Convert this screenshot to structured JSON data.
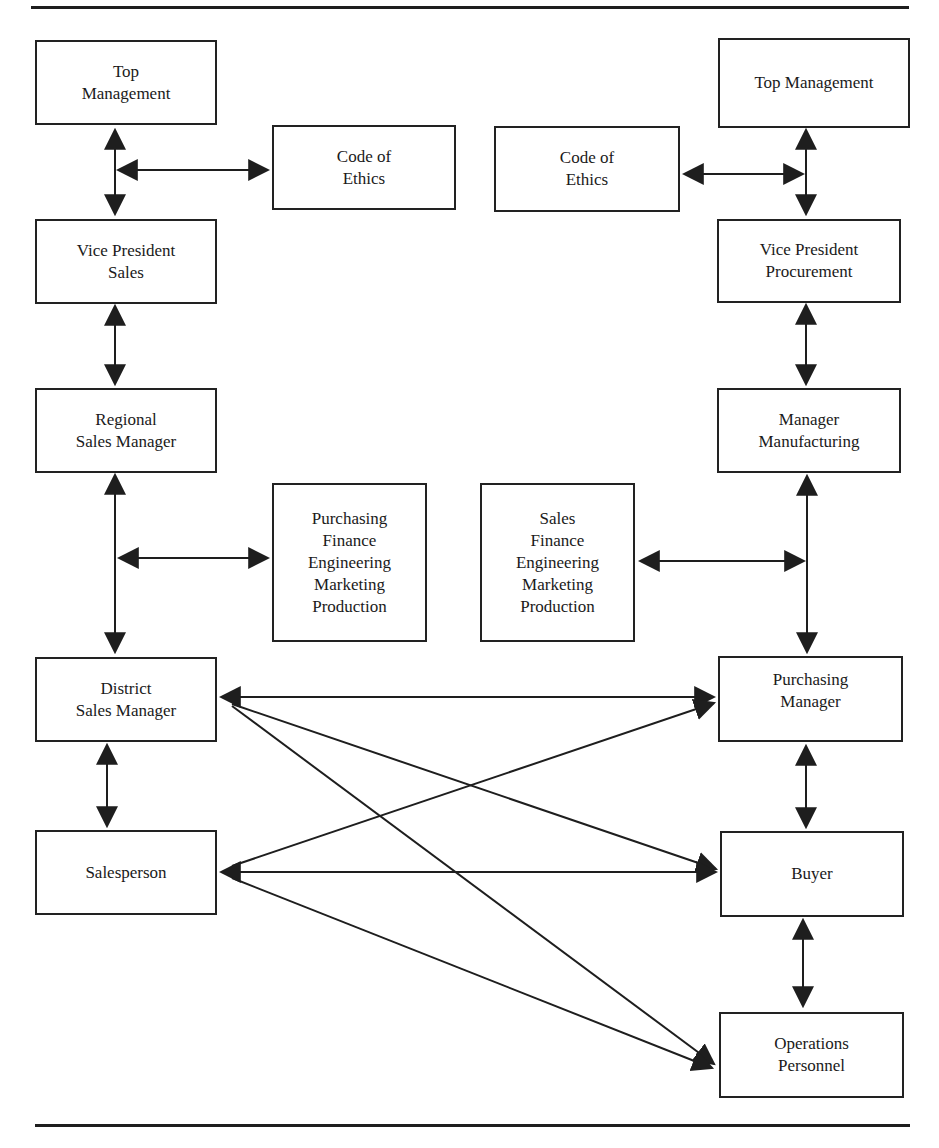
{
  "diagram": {
    "type": "organizational interaction diagram",
    "colors": {
      "ink": "#1e1e1e",
      "background": "#ffffff"
    },
    "seller_side": {
      "top_management": "Top\nManagement",
      "code_of_ethics": "Code of\nEthics",
      "vp": "Vice President\nSales",
      "regional_manager": "Regional\nSales Manager",
      "other_departments": "Purchasing\nFinance\nEngineering\nMarketing\nProduction",
      "district_manager": "District\nSales Manager",
      "salesperson": "Salesperson"
    },
    "buyer_side": {
      "top_management": "Top Management",
      "code_of_ethics": "Code of\nEthics",
      "vp": "Vice President\nProcurement",
      "manager": "Manager\nManufacturing",
      "other_departments": "Sales\nFinance\nEngineering\nMarketing\nProduction",
      "purchasing_manager": "Purchasing\nManager",
      "buyer": "Buyer",
      "operations": "Operations\nPersonnel"
    },
    "connections": [
      {
        "from": "seller_top_management",
        "to": "seller_vp",
        "bidirectional": true
      },
      {
        "from": "seller_vertical_axis",
        "to": "seller_code_of_ethics",
        "bidirectional": true
      },
      {
        "from": "seller_vp",
        "to": "seller_regional_manager",
        "bidirectional": true
      },
      {
        "from": "seller_regional_manager",
        "to": "seller_district_manager",
        "bidirectional": true
      },
      {
        "from": "seller_vertical_axis",
        "to": "seller_other_departments",
        "bidirectional": true
      },
      {
        "from": "seller_district_manager",
        "to": "seller_salesperson",
        "bidirectional": true
      },
      {
        "from": "buyer_top_management",
        "to": "buyer_vp",
        "bidirectional": true
      },
      {
        "from": "buyer_code_of_ethics",
        "to": "buyer_vertical_axis",
        "bidirectional": true
      },
      {
        "from": "buyer_vp",
        "to": "buyer_manager",
        "bidirectional": true
      },
      {
        "from": "buyer_manager",
        "to": "buyer_purchasing_manager",
        "bidirectional": true
      },
      {
        "from": "buyer_other_departments",
        "to": "buyer_vertical_axis",
        "bidirectional": true
      },
      {
        "from": "buyer_purchasing_manager",
        "to": "buyer_buyer",
        "bidirectional": true
      },
      {
        "from": "buyer_buyer",
        "to": "buyer_operations",
        "bidirectional": true
      },
      {
        "from": "seller_district_manager",
        "to": "buyer_purchasing_manager",
        "bidirectional": true
      },
      {
        "from": "seller_district_manager",
        "to": "buyer_buyer",
        "bidirectional": true
      },
      {
        "from": "seller_district_manager",
        "to": "buyer_operations",
        "bidirectional": true
      },
      {
        "from": "seller_salesperson",
        "to": "buyer_purchasing_manager",
        "bidirectional": true
      },
      {
        "from": "seller_salesperson",
        "to": "buyer_buyer",
        "bidirectional": true
      },
      {
        "from": "seller_salesperson",
        "to": "buyer_operations",
        "bidirectional": true
      }
    ]
  }
}
